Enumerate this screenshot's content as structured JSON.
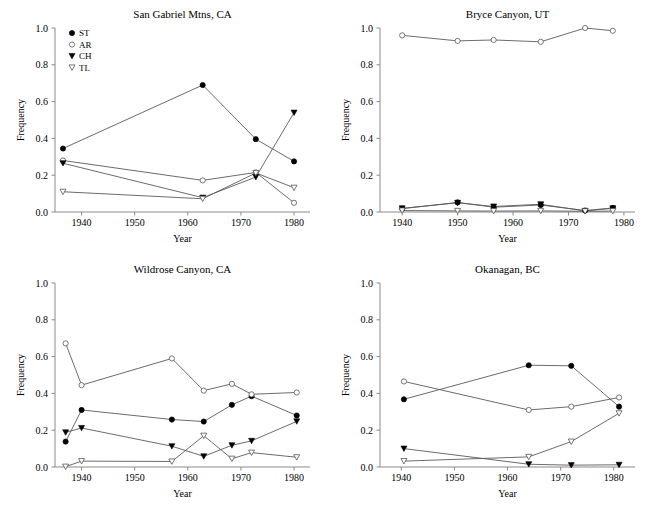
{
  "figure": {
    "axis_title_x": "Year",
    "axis_title_y": "Frequency",
    "ytick_labels": [
      "0.0",
      "0.2",
      "0.4",
      "0.6",
      "0.8",
      "1.0"
    ],
    "xtick_labels": [
      "1940",
      "1950",
      "1960",
      "1970",
      "1980"
    ],
    "line_color": "#5a5a5a",
    "axis_color": "#8a8a8a",
    "marker_fill_solid": "#000000",
    "marker_fill_open": "#ffffff"
  },
  "legend": {
    "position": "top-left-panel-1",
    "entries": [
      {
        "label": "ST",
        "marker": "filled-circle"
      },
      {
        "label": "AR",
        "marker": "open-circle"
      },
      {
        "label": "CH",
        "marker": "filled-triangle-down"
      },
      {
        "label": "TL",
        "marker": "open-triangle-down"
      }
    ]
  },
  "chart_data": [
    {
      "type": "line",
      "title": "San Gabriel Mtns, CA",
      "xlabel": "Year",
      "ylabel": "Frequency",
      "xlim": [
        1935,
        1983
      ],
      "ylim": [
        0.0,
        1.0
      ],
      "xticks": [
        1940,
        1950,
        1960,
        1970,
        1980
      ],
      "yticks": [
        0.0,
        0.2,
        0.4,
        0.6,
        0.8,
        1.0
      ],
      "grid": false,
      "series": [
        {
          "name": "ST",
          "marker": "filled-circle",
          "x": [
            1936.5,
            1962.8,
            1972.8,
            1980.0
          ],
          "values": [
            0.345,
            0.69,
            0.396,
            0.275
          ]
        },
        {
          "name": "AR",
          "marker": "open-circle",
          "x": [
            1936.5,
            1962.8,
            1972.8,
            1980.0
          ],
          "values": [
            0.28,
            0.172,
            0.215,
            0.05
          ]
        },
        {
          "name": "CH",
          "marker": "filled-triangle-down",
          "x": [
            1936.5,
            1962.8,
            1972.8,
            1980.0
          ],
          "values": [
            0.265,
            0.078,
            0.19,
            0.54
          ]
        },
        {
          "name": "TL",
          "marker": "open-triangle-down",
          "x": [
            1936.5,
            1962.8,
            1972.8,
            1980.0
          ],
          "values": [
            0.11,
            0.072,
            0.212,
            0.132
          ]
        }
      ]
    },
    {
      "type": "line",
      "title": "Bryce Canyon, UT",
      "xlabel": "Year",
      "ylabel": "Frequency",
      "xlim": [
        1936,
        1982
      ],
      "ylim": [
        0.0,
        1.0
      ],
      "xticks": [
        1940,
        1950,
        1960,
        1970,
        1980
      ],
      "yticks": [
        0.0,
        0.2,
        0.4,
        0.6,
        0.8,
        1.0
      ],
      "grid": false,
      "series": [
        {
          "name": "ST",
          "marker": "filled-circle",
          "x": [
            1940.0,
            1950.0,
            1956.5,
            1965.0,
            1973.0,
            1978.0
          ],
          "values": [
            0.018,
            0.052,
            0.026,
            0.038,
            0.008,
            0.022
          ]
        },
        {
          "name": "AR",
          "marker": "open-circle",
          "x": [
            1940.0,
            1950.0,
            1956.5,
            1965.0,
            1973.0,
            1978.0
          ],
          "values": [
            0.96,
            0.93,
            0.935,
            0.925,
            1.0,
            0.985
          ]
        },
        {
          "name": "CH",
          "marker": "filled-triangle-down",
          "x": [
            1940.0,
            1950.0,
            1956.5,
            1965.0,
            1973.0,
            1978.0
          ],
          "values": [
            0.02,
            0.05,
            0.03,
            0.042,
            0.006,
            0.02
          ]
        },
        {
          "name": "TL",
          "marker": "open-triangle-down",
          "x": [
            1940.0,
            1950.0,
            1956.5,
            1965.0,
            1973.0,
            1978.0
          ],
          "values": [
            0.008,
            0.006,
            0.005,
            0.006,
            0.004,
            0.005
          ]
        }
      ]
    },
    {
      "type": "line",
      "title": "Wildrose Canyon, CA",
      "xlabel": "Year",
      "ylabel": "Frequency",
      "xlim": [
        1935,
        1983
      ],
      "ylim": [
        0.0,
        1.0
      ],
      "xticks": [
        1940,
        1950,
        1960,
        1970,
        1980
      ],
      "yticks": [
        0.0,
        0.2,
        0.4,
        0.6,
        0.8,
        1.0
      ],
      "grid": false,
      "series": [
        {
          "name": "ST",
          "marker": "filled-circle",
          "x": [
            1937.0,
            1940.0,
            1957.0,
            1963.0,
            1968.3,
            1972.0,
            1980.5
          ],
          "values": [
            0.138,
            0.31,
            0.258,
            0.247,
            0.338,
            0.385,
            0.28
          ]
        },
        {
          "name": "AR",
          "marker": "open-circle",
          "x": [
            1937.0,
            1940.0,
            1957.0,
            1963.0,
            1968.3,
            1972.0,
            1980.5
          ],
          "values": [
            0.672,
            0.445,
            0.59,
            0.415,
            0.452,
            0.395,
            0.405
          ]
        },
        {
          "name": "CH",
          "marker": "filled-triangle-down",
          "x": [
            1937.0,
            1940.0,
            1957.0,
            1963.0,
            1968.3,
            1972.0,
            1980.5
          ],
          "values": [
            0.188,
            0.212,
            0.113,
            0.058,
            0.118,
            0.142,
            0.248
          ]
        },
        {
          "name": "TL",
          "marker": "open-triangle-down",
          "x": [
            1937.0,
            1940.0,
            1957.0,
            1963.0,
            1968.3,
            1972.0,
            1980.5
          ],
          "values": [
            0.002,
            0.032,
            0.03,
            0.17,
            0.045,
            0.078,
            0.053
          ]
        }
      ]
    },
    {
      "type": "line",
      "title": "Okanagan, BC",
      "xlabel": "Year",
      "ylabel": "Frequency",
      "xlim": [
        1936,
        1984
      ],
      "ylim": [
        0.0,
        1.0
      ],
      "xticks": [
        1940,
        1950,
        1960,
        1970,
        1980
      ],
      "yticks": [
        0.0,
        0.2,
        0.4,
        0.6,
        0.8,
        1.0
      ],
      "grid": false,
      "series": [
        {
          "name": "ST",
          "marker": "filled-circle",
          "x": [
            1940.5,
            1964.0,
            1972.0,
            1981.0
          ],
          "values": [
            0.368,
            0.553,
            0.55,
            0.328
          ]
        },
        {
          "name": "AR",
          "marker": "open-circle",
          "x": [
            1940.5,
            1964.0,
            1972.0,
            1981.0
          ],
          "values": [
            0.465,
            0.31,
            0.328,
            0.378
          ]
        },
        {
          "name": "CH",
          "marker": "filled-triangle-down",
          "x": [
            1940.5,
            1964.0,
            1972.0,
            1981.0
          ],
          "values": [
            0.1,
            0.015,
            0.01,
            0.012
          ]
        },
        {
          "name": "TL",
          "marker": "open-triangle-down",
          "x": [
            1940.5,
            1964.0,
            1972.0,
            1981.0
          ],
          "values": [
            0.032,
            0.055,
            0.138,
            0.292
          ]
        }
      ]
    }
  ]
}
